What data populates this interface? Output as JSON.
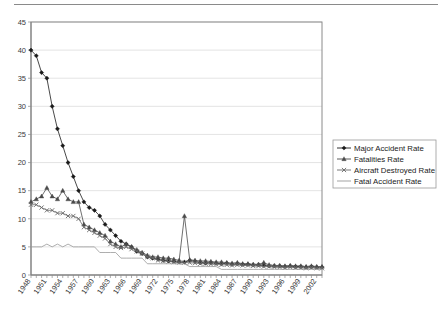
{
  "chart_data": {
    "type": "line",
    "title": "",
    "subtitle": "",
    "xlabel": "",
    "ylabel": "",
    "ylim": [
      0,
      45
    ],
    "xlim": [
      1948,
      2003
    ],
    "grid": true,
    "legend_position": "right",
    "ytick_labels": [
      "0",
      "5",
      "10",
      "15",
      "20",
      "25",
      "30",
      "35",
      "40",
      "45"
    ],
    "ytick_values": [
      0,
      5,
      10,
      15,
      20,
      25,
      30,
      35,
      40,
      45
    ],
    "xtick_labels": [
      "1948",
      "1951",
      "1954",
      "1957",
      "1960",
      "1963",
      "1966",
      "1969",
      "1972",
      "1975",
      "1978",
      "1981",
      "1984",
      "1987",
      "1990",
      "1993",
      "1996",
      "1999",
      "2002"
    ],
    "xtick_values": [
      1948,
      1951,
      1954,
      1957,
      1960,
      1963,
      1966,
      1969,
      1972,
      1975,
      1978,
      1981,
      1984,
      1987,
      1990,
      1993,
      1996,
      1999,
      2002
    ],
    "x": [
      1948,
      1949,
      1950,
      1951,
      1952,
      1953,
      1954,
      1955,
      1956,
      1957,
      1958,
      1959,
      1960,
      1961,
      1962,
      1963,
      1964,
      1965,
      1966,
      1967,
      1968,
      1969,
      1970,
      1971,
      1972,
      1973,
      1974,
      1975,
      1976,
      1977,
      1978,
      1979,
      1980,
      1981,
      1982,
      1983,
      1984,
      1985,
      1986,
      1987,
      1988,
      1989,
      1990,
      1991,
      1992,
      1993,
      1994,
      1995,
      1996,
      1997,
      1998,
      1999,
      2000,
      2001,
      2002,
      2003
    ],
    "series": [
      {
        "name": "Major Accident Rate",
        "marker": "diamond",
        "color": "#1a1a1a",
        "values": [
          40.0,
          39.0,
          36.0,
          35.0,
          30.0,
          26.0,
          23.0,
          20.0,
          17.5,
          15.0,
          13.0,
          12.0,
          11.5,
          10.5,
          9.0,
          8.0,
          7.0,
          6.0,
          5.5,
          5.0,
          4.2,
          3.8,
          3.2,
          3.0,
          2.8,
          2.6,
          2.5,
          2.4,
          2.3,
          2.3,
          2.6,
          2.4,
          2.2,
          2.1,
          2.2,
          2.1,
          2.0,
          2.1,
          1.9,
          2.0,
          1.9,
          1.9,
          1.8,
          1.8,
          1.7,
          1.6,
          1.6,
          1.6,
          1.5,
          1.6,
          1.5,
          1.5,
          1.4,
          1.5,
          1.4,
          1.4
        ]
      },
      {
        "name": "Fatalities Rate",
        "marker": "triangle",
        "color": "#4a4a4a",
        "values": [
          13.0,
          13.5,
          14.0,
          15.5,
          14.0,
          13.5,
          15.0,
          13.5,
          13.0,
          13.0,
          9.0,
          8.5,
          8.0,
          7.5,
          7.0,
          6.0,
          5.5,
          5.0,
          5.5,
          5.0,
          4.5,
          4.0,
          3.5,
          3.2,
          3.2,
          3.0,
          3.0,
          2.8,
          2.6,
          10.5,
          2.7,
          2.6,
          2.5,
          2.5,
          2.4,
          2.3,
          2.3,
          2.2,
          2.1,
          2.2,
          2.0,
          2.0,
          1.9,
          1.9,
          2.2,
          1.8,
          1.7,
          1.7,
          1.6,
          1.7,
          1.6,
          1.6,
          1.5,
          1.6,
          1.5,
          1.5
        ]
      },
      {
        "name": "Aircraft Destroyed Rate",
        "marker": "x",
        "color": "#6a6a6a",
        "values": [
          12.5,
          12.5,
          12.0,
          11.5,
          11.5,
          11.0,
          11.0,
          10.5,
          10.5,
          10.0,
          8.5,
          8.0,
          7.5,
          7.0,
          6.5,
          5.5,
          5.0,
          4.8,
          5.0,
          4.6,
          4.2,
          3.8,
          3.2,
          3.0,
          2.6,
          2.5,
          2.4,
          2.3,
          2.2,
          2.2,
          2.2,
          2.1,
          2.0,
          2.0,
          1.9,
          1.9,
          1.8,
          1.8,
          1.7,
          1.8,
          1.7,
          1.7,
          1.6,
          1.6,
          1.5,
          1.5,
          1.4,
          1.4,
          1.3,
          1.4,
          1.3,
          1.3,
          1.2,
          1.3,
          1.2,
          1.2
        ]
      },
      {
        "name": "Fatal Accident Rate",
        "marker": "none",
        "color": "#999999",
        "values": [
          5.0,
          5.0,
          5.0,
          5.5,
          5.0,
          5.5,
          5.0,
          5.5,
          5.0,
          5.0,
          5.0,
          5.0,
          5.0,
          4.0,
          4.0,
          4.0,
          4.0,
          3.0,
          3.0,
          3.0,
          3.0,
          3.0,
          2.0,
          2.0,
          2.0,
          2.0,
          2.0,
          2.0,
          2.0,
          2.0,
          1.5,
          1.5,
          1.5,
          1.5,
          1.5,
          1.5,
          1.0,
          1.0,
          1.0,
          1.0,
          1.0,
          1.0,
          1.0,
          1.0,
          1.0,
          1.0,
          1.0,
          1.0,
          1.0,
          1.0,
          1.0,
          1.0,
          1.0,
          1.0,
          1.0,
          1.0
        ]
      }
    ]
  },
  "legend": {
    "entries": [
      {
        "label": "Major Accident Rate"
      },
      {
        "label": "Fatalities Rate"
      },
      {
        "label": "Aircraft Destroyed Rate"
      },
      {
        "label": "Fatal Accident Rate"
      }
    ]
  }
}
